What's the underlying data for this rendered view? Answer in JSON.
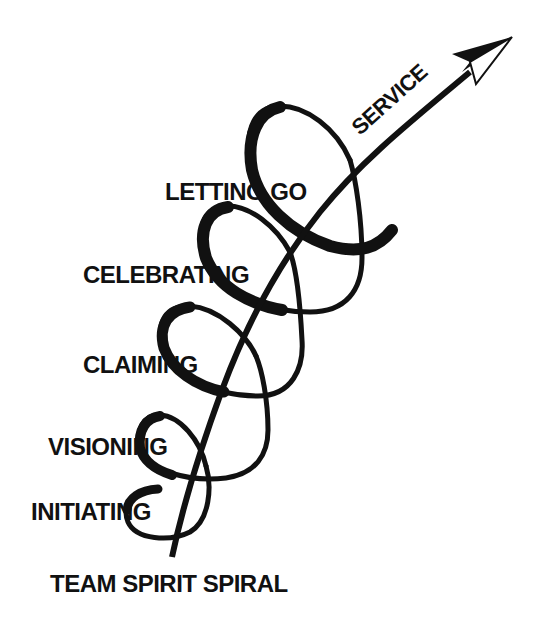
{
  "diagram": {
    "title": "TEAM SPIRIT SPIRAL",
    "arrow_label": "SERVICE",
    "stages": [
      {
        "label": "INITIATING"
      },
      {
        "label": "VISIONING"
      },
      {
        "label": "CLAIMING"
      },
      {
        "label": "CELEBRATING"
      },
      {
        "label": "LETTING GO"
      }
    ],
    "colors": {
      "ink": "#111111",
      "background": "#ffffff"
    }
  }
}
